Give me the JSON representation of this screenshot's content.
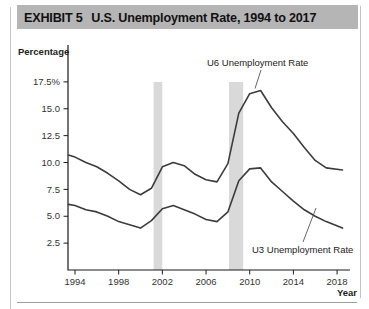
{
  "header": {
    "exhibit_label": "EXHIBIT 5",
    "title": "U.S. Unemployment Rate, 1994 to 2017"
  },
  "chart": {
    "y_axis_title": "Percentage",
    "x_axis_title": "Year"
  },
  "colors": {
    "title_bar_bg": "#b5b5b5",
    "recession_band": "#d9d9d9",
    "line": "#3c3c3c",
    "axis": "#1a1a1a",
    "tick_text": "#333333",
    "leader": "#555555"
  },
  "chart_data": {
    "type": "line",
    "title": "U.S. Unemployment Rate, 1994 to 2017",
    "xlabel": "Year",
    "ylabel": "Percentage",
    "xlim": [
      1993.4,
      2019.2
    ],
    "ylim": [
      0,
      21
    ],
    "grid": false,
    "legend_position": "inline-annotations",
    "y_ticks": [
      {
        "value": 17.5,
        "label": "17.5%"
      },
      {
        "value": 15.0,
        "label": "15.0"
      },
      {
        "value": 12.5,
        "label": "12.5"
      },
      {
        "value": 10.0,
        "label": "10.0"
      },
      {
        "value": 7.5,
        "label": "7.5"
      },
      {
        "value": 5.0,
        "label": "5.0"
      },
      {
        "value": 2.5,
        "label": "2.5"
      }
    ],
    "x_ticks": [
      {
        "value": 1994,
        "label": "1994"
      },
      {
        "value": 1998,
        "label": "1998"
      },
      {
        "value": 2002,
        "label": "2002"
      },
      {
        "value": 2006,
        "label": "2006"
      },
      {
        "value": 2010,
        "label": "2010"
      },
      {
        "value": 2014,
        "label": "2014"
      },
      {
        "value": 2018,
        "label": "2018"
      }
    ],
    "recession_bands": [
      {
        "from": 2001.2,
        "to": 2002.0
      },
      {
        "from": 2008.1,
        "to": 2009.4
      }
    ],
    "x": [
      1993.4,
      1994,
      1995,
      1996,
      1997,
      1998,
      1999,
      2000,
      2001,
      2002,
      2003,
      2004,
      2005,
      2006,
      2007,
      2008,
      2009,
      2010,
      2011,
      2012,
      2013,
      2014,
      2015,
      2016,
      2017,
      2018.5
    ],
    "series": [
      {
        "key": "u6",
        "name": "U6 Unemployment Rate",
        "values": [
          10.7,
          10.5,
          10.0,
          9.6,
          9.0,
          8.3,
          7.5,
          7.0,
          7.6,
          9.6,
          10.0,
          9.7,
          8.9,
          8.4,
          8.2,
          9.9,
          14.6,
          16.4,
          16.7,
          15.1,
          13.8,
          12.7,
          11.4,
          10.2,
          9.5,
          9.3
        ]
      },
      {
        "key": "u3",
        "name": "U3 Unemployment Rate",
        "values": [
          6.1,
          6.0,
          5.6,
          5.4,
          5.0,
          4.5,
          4.2,
          3.9,
          4.6,
          5.7,
          6.0,
          5.6,
          5.2,
          4.7,
          4.5,
          5.4,
          8.3,
          9.4,
          9.5,
          8.2,
          7.3,
          6.4,
          5.6,
          5.0,
          4.5,
          3.9
        ]
      }
    ],
    "annotations": [
      {
        "key": "u6",
        "text": "U6 Unemployment Rate"
      },
      {
        "key": "u3",
        "text": "U3 Unemployment Rate"
      }
    ]
  }
}
